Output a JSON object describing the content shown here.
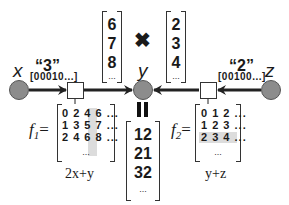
{
  "variables": {
    "x": {
      "label": "x"
    },
    "y": {
      "label": "y"
    },
    "z": {
      "label": "z"
    }
  },
  "evidence": {
    "left": {
      "value": "“3”",
      "onehot": "[00010...]"
    },
    "right": {
      "value": "“2”",
      "onehot": "[00100...]"
    }
  },
  "messages": {
    "from_f1": {
      "values": [
        "6",
        "7",
        "8"
      ],
      "ellipsis": "..."
    },
    "from_f2": {
      "values": [
        "2",
        "3",
        "4"
      ],
      "ellipsis": "..."
    },
    "product_symbol": "✖",
    "equals_symbol": "=",
    "result": {
      "values": [
        "12",
        "21",
        "32"
      ],
      "ellipsis": "..."
    }
  },
  "factors": {
    "f1": {
      "name": "f",
      "subscript": "1",
      "equals": "=",
      "rows": [
        "0 2 4 6 ...",
        "1 3 5 7 ...",
        "2 4 6 8 ..."
      ],
      "ellipsis": "...",
      "formula": "2x+y",
      "highlight": "column 4"
    },
    "f2": {
      "name": "f",
      "subscript": "2",
      "equals": "=",
      "rows": [
        "0 1 2 ...",
        "1 2 3 ...",
        "2 3 4 ..."
      ],
      "ellipsis": "...",
      "formula": "y+z",
      "highlight": "row 3"
    }
  },
  "colors": {
    "node_fill": "#8c8c8c",
    "edge": "#222222",
    "highlight": "#dcdcdc"
  }
}
